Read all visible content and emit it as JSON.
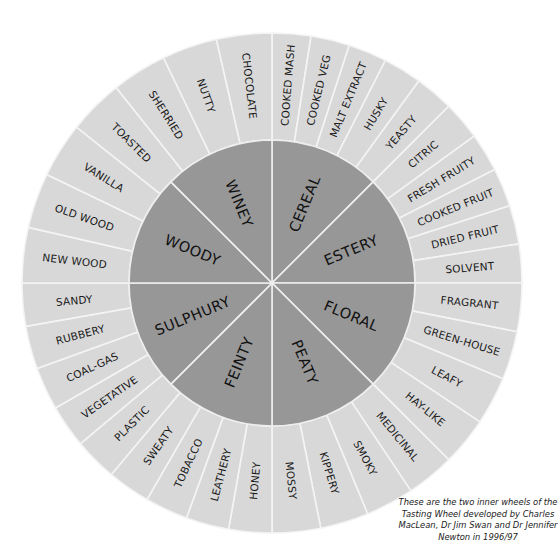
{
  "wheel": {
    "center": [
      272,
      283
    ],
    "outer_radius": 250,
    "inner_radius": 143,
    "colors": {
      "outer_fill": "#d8d8d8",
      "inner_fill": "#979797",
      "divider": "#f4f4f4",
      "text": "#1a1a1a"
    },
    "inner_categories": [
      {
        "label": "CEREAL",
        "start_deg": 0,
        "end_deg": 45
      },
      {
        "label": "ESTERY",
        "start_deg": 45,
        "end_deg": 90
      },
      {
        "label": "FLORAL",
        "start_deg": 90,
        "end_deg": 135
      },
      {
        "label": "PEATY",
        "start_deg": 135,
        "end_deg": 180
      },
      {
        "label": "FEINTY",
        "start_deg": 180,
        "end_deg": 225
      },
      {
        "label": "SULPHURY",
        "start_deg": 225,
        "end_deg": 270
      },
      {
        "label": "WOODY",
        "start_deg": 270,
        "end_deg": 315
      },
      {
        "label": "WINEY",
        "start_deg": 315,
        "end_deg": 360
      }
    ],
    "outer_quadrants": [
      {
        "start_deg": 0,
        "end_deg": 90,
        "labels": [
          "COOKED MASH",
          "COOKED VEG",
          "MALT EXTRACT",
          "HUSKY",
          "YEASTY",
          "CITRIC",
          "FRESH FRUITY",
          "COOKED FRUIT",
          "DRIED FRUIT",
          "SOLVENT"
        ]
      },
      {
        "start_deg": 90,
        "end_deg": 180,
        "labels": [
          "FRAGRANT",
          "GREEN-HOUSE",
          "LEAFY",
          "HAY-LIKE",
          "MEDICINAL",
          "SMOKY",
          "KIPPERY",
          "MOSSY"
        ]
      },
      {
        "start_deg": 180,
        "end_deg": 270,
        "labels": [
          "HONEY",
          "LEATHERY",
          "TOBACCO",
          "SWEATY",
          "PLASTIC",
          "VEGETATIVE",
          "COAL-GAS",
          "RUBBERY",
          "SANDY"
        ]
      },
      {
        "start_deg": 270,
        "end_deg": 360,
        "labels": [
          "NEW WOOD",
          "OLD WOOD",
          "VANILLA",
          "TOASTED",
          "SHERRIED",
          "NUTTY",
          "CHOCOLATE"
        ]
      }
    ]
  },
  "caption": {
    "text": "These are the two inner wheels of the Tasting Wheel developed by Charles MacLean, Dr Jim Swan and Dr Jennifer Newton in 1996/97"
  }
}
